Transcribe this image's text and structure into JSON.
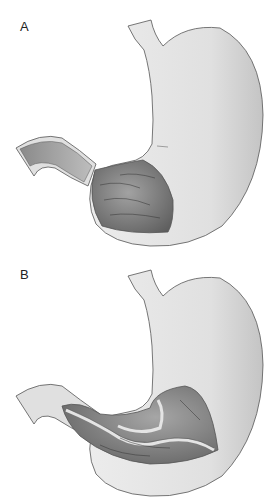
{
  "figure": {
    "panels": [
      {
        "label": "A",
        "description": "Stomach with distal antrum and duodenum cut open"
      },
      {
        "label": "B",
        "description": "Stomach with antrum cut open showing inner lumen fold"
      }
    ],
    "colors": {
      "outer_wall": "#e2e2e2",
      "outline": "#555555",
      "lumen_dark": "#6a6a6a",
      "lumen_mid": "#9a9a9a",
      "background": "#ffffff"
    },
    "caption": ""
  }
}
